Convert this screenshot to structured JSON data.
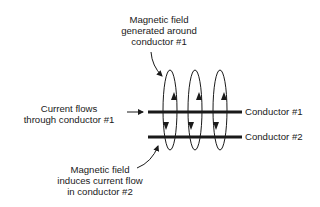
{
  "diagram": {
    "type": "electromagnetic-induction",
    "labels": {
      "top": [
        "Magnetic field",
        "generated around",
        "conductor #1"
      ],
      "left": [
        "Current flows",
        "through conductor #1"
      ],
      "bottom": [
        "Magnetic field",
        "induces current flow",
        "in conductor #2"
      ],
      "conductor1": "Conductor #1",
      "conductor2": "Conductor #2"
    },
    "conductors": [
      {
        "name": "Conductor #1",
        "x1": 148,
        "x2": 242,
        "y": 112
      },
      {
        "name": "Conductor #2",
        "x1": 148,
        "x2": 242,
        "y": 137
      }
    ],
    "field_loops": [
      {
        "cx": 170,
        "cy": 110,
        "rx": 7,
        "ry": 40
      },
      {
        "cx": 195,
        "cy": 110,
        "rx": 7,
        "ry": 40
      },
      {
        "cx": 220,
        "cy": 110,
        "rx": 7,
        "ry": 40
      }
    ],
    "colors": {
      "ink": "#1a1a1a",
      "background": "#ffffff"
    }
  }
}
